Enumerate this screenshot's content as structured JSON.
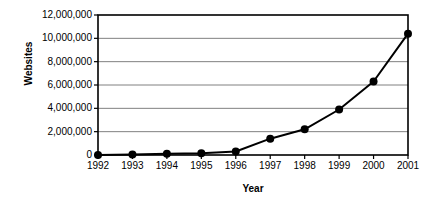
{
  "chart_data": {
    "type": "line",
    "title": "",
    "xlabel": "Year",
    "ylabel": "Websites",
    "categories": [
      "1992",
      "1993",
      "1994",
      "1995",
      "1996",
      "1997",
      "1998",
      "1999",
      "2000",
      "2001"
    ],
    "x": [
      1992,
      1993,
      1994,
      1995,
      1996,
      1997,
      1998,
      1999,
      2000,
      2001
    ],
    "values": [
      0,
      50000,
      100000,
      150000,
      300000,
      1400000,
      2200000,
      3900000,
      6300000,
      10400000
    ],
    "series": [
      {
        "name": "Websites",
        "values": [
          0,
          50000,
          100000,
          150000,
          300000,
          1400000,
          2200000,
          3900000,
          6300000,
          10400000
        ]
      }
    ],
    "ylim": [
      0,
      12000000
    ],
    "ytick_values": [
      0,
      2000000,
      4000000,
      6000000,
      8000000,
      10000000,
      12000000
    ],
    "ytick_labels": [
      "0",
      "2,000,000",
      "4,000,000",
      "6,000,000",
      "8,000,000",
      "10,000,000",
      "12,000,000"
    ],
    "grid": true,
    "grid_axis": "y",
    "legend": false,
    "legend_position": "none",
    "colors": {
      "line": "#000000",
      "marker": "#000000",
      "gridline": "#808080",
      "axis": "#000000",
      "background": "#ffffff",
      "text": "#000000"
    }
  }
}
